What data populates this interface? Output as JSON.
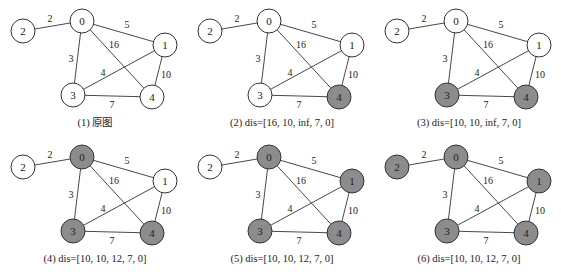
{
  "figure": {
    "colors": {
      "visited": "#8c8c8c",
      "unvisited": "#ffffff",
      "stroke": "#333333"
    },
    "nodes": [
      {
        "id": "0",
        "x": 82,
        "y": 21
      },
      {
        "id": "1",
        "x": 165,
        "y": 45
      },
      {
        "id": "2",
        "x": 23,
        "y": 31
      },
      {
        "id": "3",
        "x": 73,
        "y": 95
      },
      {
        "id": "4",
        "x": 152,
        "y": 97
      }
    ],
    "edges": [
      {
        "from": "2",
        "to": "0",
        "weight": "2",
        "lx": 50,
        "ly": 18
      },
      {
        "from": "0",
        "to": "1",
        "weight": "5",
        "lx": 127,
        "ly": 24
      },
      {
        "from": "0",
        "to": "4",
        "weight": "16",
        "lx": 114,
        "ly": 44
      },
      {
        "from": "0",
        "to": "3",
        "weight": "3",
        "lx": 71,
        "ly": 58
      },
      {
        "from": "1",
        "to": "3",
        "weight": "4",
        "lx": 103,
        "ly": 72
      },
      {
        "from": "1",
        "to": "4",
        "weight": "10",
        "lx": 166,
        "ly": 74
      },
      {
        "from": "3",
        "to": "4",
        "weight": "7",
        "lx": 112,
        "ly": 104
      }
    ],
    "panels": [
      {
        "caption": "(1) 原图",
        "visited": []
      },
      {
        "caption": "(2) dis=[16, 10, inf, 7, 0]",
        "visited": [
          "4"
        ]
      },
      {
        "caption": "(3) dis=[10, 10, inf, 7, 0]",
        "visited": [
          "4",
          "3"
        ]
      },
      {
        "caption": "(4) dis=[10, 10, 12, 7, 0]",
        "visited": [
          "4",
          "3",
          "0"
        ]
      },
      {
        "caption": "(5) dis=[10, 10, 12, 7, 0]",
        "visited": [
          "4",
          "3",
          "0",
          "1"
        ]
      },
      {
        "caption": "(6) dis=[10, 10, 12, 7, 0]",
        "visited": [
          "4",
          "3",
          "0",
          "1",
          "2"
        ]
      }
    ]
  }
}
